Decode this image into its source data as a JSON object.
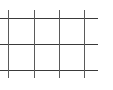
{
  "grid": {
    "line_color": "#3a3a3a",
    "horizontal_lines_y": [
      18,
      44,
      70
    ],
    "horizontal_line_end_x": 98,
    "vertical_lines_x": [
      8,
      34,
      59,
      84
    ],
    "vertical_line_span_y": [
      10,
      78
    ]
  }
}
